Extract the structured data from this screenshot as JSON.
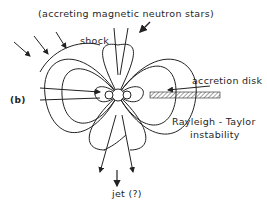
{
  "figure": {
    "panel_label": "(b)",
    "title": "(accreting magnetic neutron stars)",
    "labels": {
      "shock": "shock",
      "accretion_disk": "accretion disk",
      "rt_line1": "Rayleigh - Taylor",
      "rt_line2": "instability",
      "jet": "jet (?)"
    }
  }
}
